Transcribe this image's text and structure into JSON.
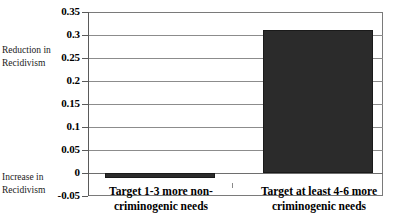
{
  "chart_data": {
    "type": "bar",
    "title": "",
    "xlabel": "",
    "ylabel": "",
    "categories": [
      "Target 1-3 more non-criminogenic needs",
      "Target at least 4-6 more criminogenic needs"
    ],
    "values": [
      -0.01,
      0.31
    ],
    "ylim": [
      -0.05,
      0.35
    ],
    "yticks": [
      0.35,
      0.3,
      0.25,
      0.2,
      0.15,
      0.1,
      0.05,
      0,
      -0.05
    ],
    "ytick_labels": [
      "0.35",
      "0.3",
      "0.25",
      "0.2",
      "0.15",
      "0.1",
      "0.05",
      "0",
      "-0.05"
    ],
    "grid": true,
    "legend": false,
    "bar_color": "#2b2b2b",
    "annotations": [
      "Reduction in Recidivism",
      "Increase in Recidivism"
    ]
  },
  "axis": {
    "ticks": [
      {
        "label": "0.35",
        "value": 0.35
      },
      {
        "label": "0.3",
        "value": 0.3
      },
      {
        "label": "0.25",
        "value": 0.25
      },
      {
        "label": "0.2",
        "value": 0.2
      },
      {
        "label": "0.15",
        "value": 0.15
      },
      {
        "label": "0.1",
        "value": 0.1
      },
      {
        "label": "0.05",
        "value": 0.05
      },
      {
        "label": "0",
        "value": 0
      },
      {
        "label": "-0.05",
        "value": -0.05
      }
    ]
  },
  "annotations": {
    "upper": {
      "line1": "Reduction in",
      "line2": "Recidivism"
    },
    "lower": {
      "line1": "Increase in",
      "line2": "Recidivism"
    }
  },
  "categories": [
    {
      "line1": "Target 1-3 more non-",
      "line2": "criminogenic needs"
    },
    {
      "line1": "Target at least 4-6 more",
      "line2": "criminogenic needs"
    }
  ]
}
